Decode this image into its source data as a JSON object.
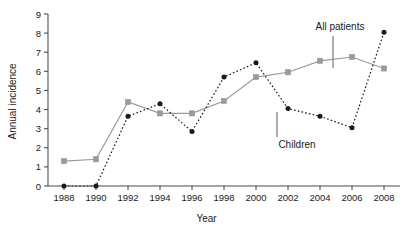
{
  "chart_data": {
    "type": "line",
    "title": "",
    "xlabel": "Year",
    "ylabel": "Annual incidence",
    "xlim": [
      1987,
      2009
    ],
    "ylim": [
      0,
      9
    ],
    "grid": false,
    "legend_position": "inline-annotations",
    "x": [
      1988,
      1990,
      1992,
      1994,
      1996,
      1998,
      2000,
      2002,
      2004,
      2006,
      2008
    ],
    "xticklabels": [
      "1988",
      "1990",
      "1992",
      "1994",
      "1996",
      "1998",
      "2000",
      "2002",
      "2004",
      "2006",
      "2008"
    ],
    "yticklabels": [
      "0",
      "1",
      "2",
      "3",
      "4",
      "5",
      "6",
      "7",
      "8",
      "9"
    ],
    "series": [
      {
        "name": "All patients",
        "marker": "square",
        "linestyle": "solid",
        "color": "#9a9a9a",
        "values": [
          1.3,
          1.4,
          4.4,
          3.8,
          3.8,
          4.45,
          5.7,
          5.95,
          6.55,
          6.75,
          6.15
        ]
      },
      {
        "name": "Children",
        "marker": "circle",
        "linestyle": "dotted",
        "color": "#1a1a1a",
        "values": [
          0.0,
          0.0,
          3.65,
          4.3,
          2.85,
          5.7,
          6.45,
          4.05,
          3.65,
          3.05,
          8.05
        ]
      }
    ],
    "annotations": [
      {
        "text": "All patients",
        "target_series": "All patients",
        "target_x": 2005
      },
      {
        "text": "Children",
        "target_series": "Children",
        "target_x": 2002
      }
    ]
  },
  "axes": {
    "x_title": "Year",
    "y_title": "Annual incidence"
  },
  "annotation_labels": {
    "all_patients": "All patients",
    "children": "Children"
  }
}
